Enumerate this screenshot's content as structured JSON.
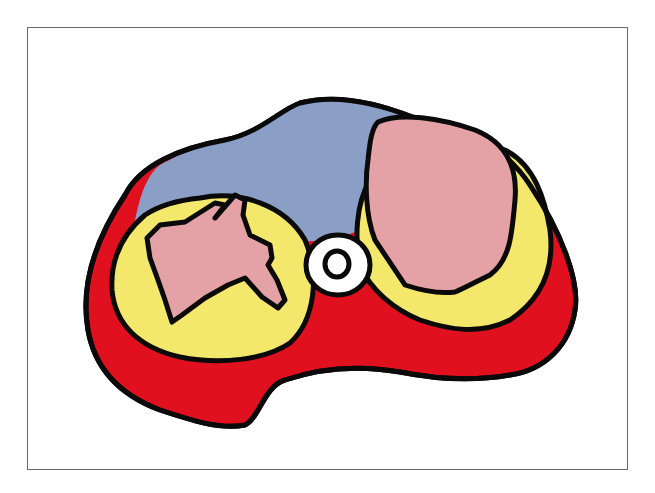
{
  "diagram": {
    "type": "cross-section illustration",
    "colors": {
      "outline": "#0a0a0a",
      "blue_region": "#8b9fc6",
      "yellow_region": "#f3e76c",
      "red_region": "#e0101f",
      "pink_region": "#e4a2a6",
      "center_ring": "#ffffff",
      "frame_border": "#6a6a6a",
      "background": "#ffffff"
    },
    "regions": [
      {
        "name": "upper-blue-region",
        "color": "blue_region"
      },
      {
        "name": "lower-red-region",
        "color": "red_region"
      },
      {
        "name": "left-yellow-region",
        "color": "yellow_region"
      },
      {
        "name": "right-yellow-region",
        "color": "yellow_region"
      },
      {
        "name": "left-pink-region",
        "color": "pink_region"
      },
      {
        "name": "right-pink-region",
        "color": "pink_region"
      },
      {
        "name": "center-ring",
        "color": "center_ring"
      }
    ]
  }
}
